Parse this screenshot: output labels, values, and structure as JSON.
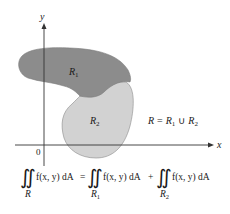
{
  "diagram": {
    "axes": {
      "x_label": "x",
      "y_label": "y",
      "origin_label": "0"
    },
    "regions": [
      {
        "id": "R1",
        "label": "R",
        "sub": "1",
        "color": "#8c8c8c"
      },
      {
        "id": "R2",
        "label": "R",
        "sub": "2",
        "color": "#d2d2d2"
      }
    ],
    "union_label": {
      "lhs": "R",
      "eq": "=",
      "r1": "R",
      "r1_sub": "1",
      "cup": "∪",
      "r2": "R",
      "r2_sub": "2"
    },
    "formula": {
      "integral": "∬",
      "integrand": "f(x, y) dA",
      "equals": "=",
      "plus": "+",
      "lower_R": "R",
      "lower_R1": "R",
      "lower_R1_sub": "1",
      "lower_R2": "R",
      "lower_R2_sub": "2"
    }
  }
}
